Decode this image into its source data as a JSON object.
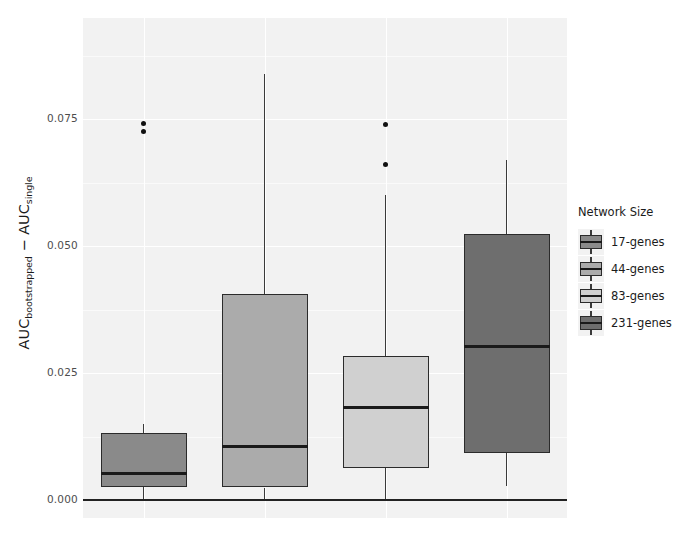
{
  "chart_data": {
    "type": "box",
    "title": "",
    "xlabel": "",
    "ylabel": "AUC_bootstrapped - AUC_single",
    "ylabel_parts": {
      "first_main": "AUC",
      "first_sub": "bootstrapped",
      "operator": " − ",
      "second_main": "AUC",
      "second_sub": "single"
    },
    "ylim": [
      -0.0035,
      0.0949
    ],
    "yticks": [
      0.0,
      0.025,
      0.05,
      0.075
    ],
    "ytick_labels": [
      "0.000",
      "0.025",
      "0.050",
      "0.075"
    ],
    "grid": true,
    "grid_color": "#ffffff",
    "panel_background": "#f2f2f2",
    "legend_position": "right",
    "reference_line": {
      "y": 0.0,
      "color": "#222222"
    },
    "categories": [
      "17-genes",
      "44-genes",
      "83-genes",
      "231-genes"
    ],
    "boxes": [
      {
        "name": "17-genes",
        "fill": "#8a8a8a",
        "whisker_low": 0.0002,
        "q1": 0.0026,
        "median": 0.0053,
        "q3": 0.0133,
        "whisker_high": 0.015,
        "outliers": [
          0.0742,
          0.0726
        ]
      },
      {
        "name": "44-genes",
        "fill": "#ababab",
        "whisker_low": 0.0002,
        "q1": 0.0025,
        "median": 0.0106,
        "q3": 0.0406,
        "whisker_high": 0.0838,
        "outliers": []
      },
      {
        "name": "83-genes",
        "fill": "#d0d0d0",
        "whisker_low": 0.0002,
        "q1": 0.0064,
        "median": 0.0182,
        "q3": 0.0284,
        "whisker_high": 0.06,
        "outliers": [
          0.074,
          0.066
        ]
      },
      {
        "name": "231-genes",
        "fill": "#6e6e6e",
        "whisker_low": 0.0029,
        "q1": 0.0094,
        "median": 0.0303,
        "q3": 0.0524,
        "whisker_high": 0.0669,
        "outliers": []
      }
    ]
  },
  "legend": {
    "title": "Network Size",
    "items": [
      {
        "label": "17-genes",
        "color": "#8a8a8a"
      },
      {
        "label": "44-genes",
        "color": "#ababab"
      },
      {
        "label": "83-genes",
        "color": "#d0d0d0"
      },
      {
        "label": "231-genes",
        "color": "#6e6e6e"
      }
    ]
  }
}
